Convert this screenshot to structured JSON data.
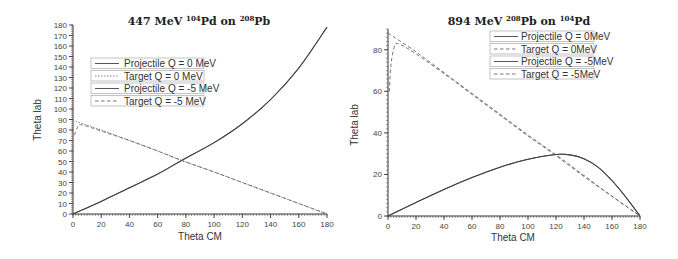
{
  "chart_data": [
    {
      "type": "line",
      "title": "447 MeV 104Pd on 208Pb",
      "title_parts": {
        "energy": "447 MeV",
        "proj_mass": "104",
        "proj": "Pd",
        "on": "on",
        "targ_mass": "208",
        "targ": "Pb"
      },
      "xlabel": "Theta CM",
      "ylabel": "Theta lab",
      "xlim": [
        0,
        180
      ],
      "ylim": [
        0,
        180
      ],
      "xticks": [
        0,
        20,
        40,
        60,
        80,
        100,
        120,
        140,
        160,
        180
      ],
      "yticks": [
        0,
        10,
        20,
        30,
        40,
        50,
        60,
        70,
        80,
        90,
        100,
        110,
        120,
        130,
        140,
        150,
        160,
        170,
        180
      ],
      "grid": false,
      "legend_position": "upper-left-inside",
      "series": [
        {
          "name": "Projectile Q = 0 MeV",
          "style": "solid",
          "x": [
            0,
            20,
            40,
            60,
            77,
            100,
            120,
            140,
            160,
            180
          ],
          "y": [
            0,
            12,
            25,
            38,
            51,
            68,
            86,
            109,
            139,
            178
          ]
        },
        {
          "name": "Target  Q = 0 MeV",
          "style": "dotted",
          "x": [
            0,
            20,
            40,
            60,
            77,
            100,
            120,
            140,
            160,
            180
          ],
          "y": [
            89,
            80,
            70,
            60,
            51,
            40,
            30,
            20,
            10,
            0
          ]
        },
        {
          "name": "Projectile Q = -5 MeV",
          "style": "solid",
          "x": [
            0,
            20,
            40,
            60,
            77,
            100,
            120,
            140,
            160,
            180
          ],
          "y": [
            0,
            12,
            25,
            38,
            51,
            68,
            86,
            109,
            139,
            178
          ]
        },
        {
          "name": "Target Q = -5 MeV",
          "style": "dashed",
          "x": [
            1,
            3,
            6,
            20,
            40,
            60,
            77,
            100,
            120,
            140,
            160,
            180
          ],
          "y": [
            75,
            82,
            85,
            79,
            70,
            60,
            51,
            40,
            30,
            20,
            10,
            0
          ]
        }
      ]
    },
    {
      "type": "line",
      "title": "894 MeV 208Pb on 104Pd",
      "title_parts": {
        "energy": "894 MeV",
        "proj_mass": "208",
        "proj": "Pb",
        "on": "on",
        "targ_mass": "104",
        "targ": "Pd"
      },
      "xlabel": "Theta CM",
      "ylabel": "Theta lab",
      "xlim": [
        0,
        180
      ],
      "ylim": [
        0,
        90
      ],
      "xticks": [
        0,
        20,
        40,
        60,
        80,
        100,
        120,
        140,
        160,
        180
      ],
      "yticks": [
        0,
        20,
        40,
        60,
        80
      ],
      "grid": false,
      "legend_position": "upper-right-inside",
      "series": [
        {
          "name": "Projectile Q = 0MeV",
          "style": "solid",
          "x": [
            0,
            20,
            40,
            60,
            80,
            100,
            120,
            130,
            140,
            150,
            160,
            170,
            180
          ],
          "y": [
            0,
            6.5,
            12.8,
            18.5,
            23.5,
            27.3,
            29.6,
            29.4,
            27.5,
            23.5,
            17.0,
            9.0,
            0
          ]
        },
        {
          "name": "Target Q = 0MeV",
          "style": "dashed",
          "x": [
            0,
            20,
            40,
            60,
            80,
            100,
            120,
            140,
            160,
            180
          ],
          "y": [
            88,
            79,
            69,
            59,
            49,
            39,
            29.5,
            19.5,
            9.5,
            0
          ]
        },
        {
          "name": "Projectile Q = -5MeV",
          "style": "solid",
          "x": [
            0,
            20,
            40,
            60,
            80,
            100,
            120,
            130,
            140,
            150,
            160,
            170,
            180
          ],
          "y": [
            0,
            6.5,
            12.8,
            18.5,
            23.5,
            27.3,
            29.6,
            29.4,
            27.5,
            23.5,
            17.0,
            9.0,
            0
          ]
        },
        {
          "name": "Target Q = -5MeV",
          "style": "dashed",
          "x": [
            1,
            2,
            4,
            7,
            20,
            40,
            60,
            80,
            100,
            120,
            140,
            160,
            180
          ],
          "y": [
            60,
            72,
            80,
            83,
            78,
            68.5,
            58.5,
            48.5,
            38.5,
            29,
            19,
            9.5,
            0
          ]
        }
      ]
    }
  ]
}
